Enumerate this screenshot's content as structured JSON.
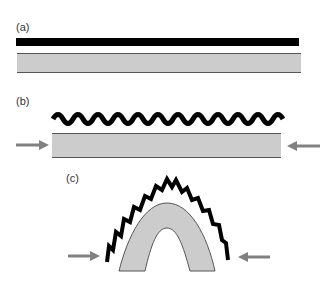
{
  "panels": [
    {
      "label": "(a)",
      "description": "flat black layer above flat gray layer"
    },
    {
      "label": "(b)",
      "description": "wavy black layer above gray layer under horizontal compression"
    },
    {
      "label": "(c)",
      "description": "folded gray layer (arch) with crumpled black layer above, compressed from both sides"
    }
  ],
  "colors": {
    "black_layer": "#000000",
    "gray_layer": "#cccccc",
    "outline": "#555555",
    "arrow": "#808080"
  }
}
